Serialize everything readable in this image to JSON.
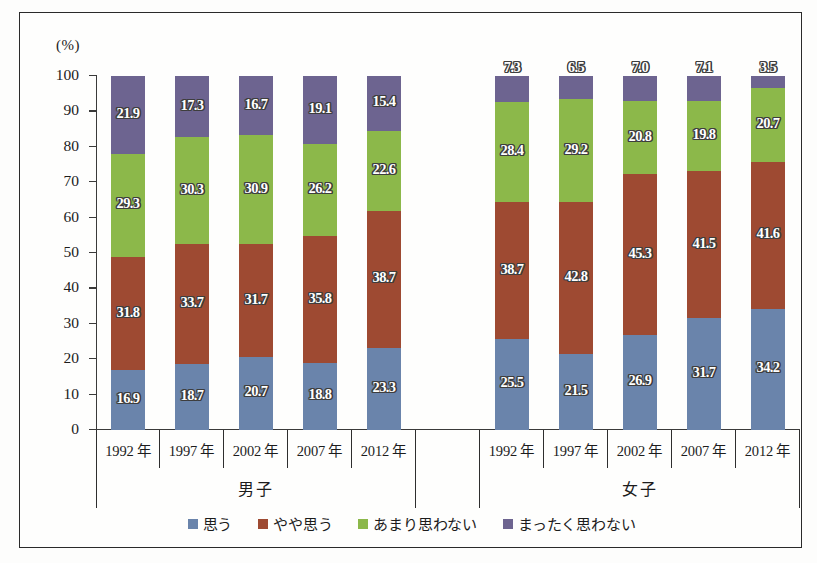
{
  "axis": {
    "unit_label": "(%)",
    "y_ticks": [
      "0",
      "10",
      "20",
      "30",
      "40",
      "50",
      "60",
      "70",
      "80",
      "90",
      "100"
    ]
  },
  "groups": [
    {
      "name": "男子",
      "categories": [
        "1992 年",
        "1997 年",
        "2002 年",
        "2007 年",
        "2012 年"
      ]
    },
    {
      "name": "女子",
      "categories": [
        "1992 年",
        "1997 年",
        "2002 年",
        "2007 年",
        "2012 年"
      ]
    }
  ],
  "legend": {
    "items": [
      {
        "label": "思う",
        "color": "#6a84ab",
        "swatch": "legend-swatch-omou"
      },
      {
        "label": "やや思う",
        "color": "#9e4a32",
        "swatch": "legend-swatch-yaya-omou"
      },
      {
        "label": "あまり思わない",
        "color": "#8cb84a",
        "swatch": "legend-swatch-amari-omowanai"
      },
      {
        "label": "まったく思わない",
        "color": "#6d6490",
        "swatch": "legend-swatch-mattaku-omowanai"
      }
    ]
  },
  "chart_data": {
    "type": "bar",
    "stacked": true,
    "stack_total": 100,
    "title": "",
    "xlabel": "",
    "ylabel": "(%)",
    "ylim": [
      0,
      100
    ],
    "ytick_step": 10,
    "grid": false,
    "legend_position": "bottom",
    "categories": [
      "男子 1992 年",
      "男子 1997 年",
      "男子 2002 年",
      "男子 2007 年",
      "男子 2012 年",
      "女子 1992 年",
      "女子 1997 年",
      "女子 2002 年",
      "女子 2007 年",
      "女子 2012 年"
    ],
    "series": [
      {
        "name": "思う",
        "color": "#6a84ab",
        "values": [
          16.9,
          18.7,
          20.7,
          18.8,
          23.3,
          25.5,
          21.5,
          26.9,
          31.7,
          34.2
        ]
      },
      {
        "name": "やや思う",
        "color": "#9e4a32",
        "values": [
          31.8,
          33.7,
          31.7,
          35.8,
          38.7,
          38.7,
          42.8,
          45.3,
          41.5,
          41.6
        ]
      },
      {
        "name": "あまり思わない",
        "color": "#8cb84a",
        "values": [
          29.3,
          30.3,
          30.9,
          26.2,
          22.6,
          28.4,
          29.2,
          20.8,
          19.8,
          20.7
        ]
      },
      {
        "name": "まったく思わない",
        "color": "#6d6490",
        "values": [
          21.9,
          17.3,
          16.7,
          19.1,
          15.4,
          7.3,
          6.5,
          7.0,
          7.1,
          3.5
        ]
      }
    ],
    "bars": [
      {
        "group": "男子",
        "category": "1992 年",
        "omou": 16.9,
        "yaya_omou": 31.8,
        "amari_omowanai": 29.3,
        "mattaku_omowanai": 21.9
      },
      {
        "group": "男子",
        "category": "1997 年",
        "omou": 18.7,
        "yaya_omou": 33.7,
        "amari_omowanai": 30.3,
        "mattaku_omowanai": 17.3
      },
      {
        "group": "男子",
        "category": "2002 年",
        "omou": 20.7,
        "yaya_omou": 31.7,
        "amari_omowanai": 30.9,
        "mattaku_omowanai": 16.7
      },
      {
        "group": "男子",
        "category": "2007 年",
        "omou": 18.8,
        "yaya_omou": 35.8,
        "amari_omowanai": 26.2,
        "mattaku_omowanai": 19.1
      },
      {
        "group": "男子",
        "category": "2012 年",
        "omou": 23.3,
        "yaya_omou": 38.7,
        "amari_omowanai": 22.6,
        "mattaku_omowanai": 15.4
      },
      {
        "group": "女子",
        "category": "1992 年",
        "omou": 25.5,
        "yaya_omou": 38.7,
        "amari_omowanai": 28.4,
        "mattaku_omowanai": 7.3
      },
      {
        "group": "女子",
        "category": "1997 年",
        "omou": 21.5,
        "yaya_omou": 42.8,
        "amari_omowanai": 29.2,
        "mattaku_omowanai": 6.5
      },
      {
        "group": "女子",
        "category": "2002 年",
        "omou": 26.9,
        "yaya_omou": 45.3,
        "amari_omowanai": 20.8,
        "mattaku_omowanai": 7.0
      },
      {
        "group": "女子",
        "category": "2007 年",
        "omou": 31.7,
        "yaya_omou": 41.5,
        "amari_omowanai": 19.8,
        "mattaku_omowanai": 7.1
      },
      {
        "group": "女子",
        "category": "2012 年",
        "omou": 34.2,
        "yaya_omou": 41.6,
        "amari_omowanai": 20.7,
        "mattaku_omowanai": 3.5
      }
    ]
  }
}
